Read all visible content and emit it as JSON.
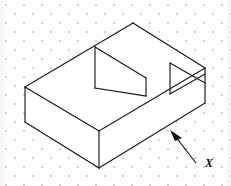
{
  "figure": {
    "surface_label": "X",
    "background_color": "#fdfdfd",
    "line_color": "#1a1a1a",
    "dot_color": "#b9b9bf",
    "canvas": {
      "width": 231,
      "height": 186
    },
    "grid": {
      "type": "isometric-dot-grid",
      "dot_radius": 0.9,
      "col_spacing": 18,
      "row_spacing": 9,
      "stagger_offset": 9,
      "origin_x": 6,
      "origin_y": 5
    },
    "solid": {
      "name": "notched-block",
      "description": "Rectangular prism with a rectangular step notch cut in the top-left and a triangular wedge notch at the right end",
      "outline_points": "25,87 133,23 205,68 205,103 99,168 25,122",
      "faces": [
        {
          "name": "front-left-face",
          "points": "25,87 99,131 99,168 25,122"
        },
        {
          "name": "front-right-face",
          "points": "99,131 205,68 205,103 99,168"
        },
        {
          "name": "top-face",
          "points": "25,87 133,23 205,68 99,131"
        }
      ],
      "edges": [
        {
          "name": "top-left-upper-edge",
          "points": "25,87 133,23"
        },
        {
          "name": "top-right-upper-edge",
          "points": "133,23 205,68"
        },
        {
          "name": "right-vertical-edge",
          "points": "205,68 205,103"
        },
        {
          "name": "bottom-right-lower-edge",
          "points": "205,103 99,168"
        },
        {
          "name": "bottom-left-lower-edge",
          "points": "99,168 25,122"
        },
        {
          "name": "left-vertical-edge",
          "points": "25,87 25,122"
        },
        {
          "name": "front-corner-vertical-edge",
          "points": "99,131 99,168"
        },
        {
          "name": "top-front-left-edge",
          "points": "25,87 99,131"
        },
        {
          "name": "top-front-right-edge",
          "points": "99,131 205,68"
        }
      ],
      "notch_step": {
        "name": "rectangular-step-notch",
        "edges": [
          {
            "name": "step-back-top-edge",
            "points": "95,47 146,78"
          },
          {
            "name": "step-left-vertical",
            "points": "95,47 95,88"
          },
          {
            "name": "step-right-vertical",
            "points": "146,78 146,96"
          },
          {
            "name": "step-floor-left-edge",
            "points": "95,88 146,96"
          }
        ]
      },
      "notch_wedge": {
        "name": "triangular-wedge-notch",
        "edges": [
          {
            "name": "wedge-left-vertical",
            "points": "170,63 170,94"
          },
          {
            "name": "wedge-lower-edge",
            "points": "170,94 205,74"
          },
          {
            "name": "wedge-upper-edge",
            "points": "170,63 205,83"
          }
        ]
      }
    },
    "leader": {
      "name": "surface-leader-arrow",
      "line_points": "196,163 175,136",
      "arrow_head_points": "170,130 182,138 175,141",
      "label": "X",
      "label_x": 205,
      "label_y": 167
    }
  }
}
